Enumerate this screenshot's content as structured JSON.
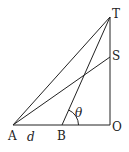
{
  "diagram": {
    "points": {
      "A": {
        "label": "A",
        "x": 13,
        "y": 125
      },
      "B": {
        "label": "B",
        "x": 62,
        "y": 125
      },
      "O": {
        "label": "O",
        "x": 110,
        "y": 125
      },
      "S": {
        "label": "S",
        "x": 110,
        "y": 57
      },
      "T": {
        "label": "T",
        "x": 110,
        "y": 17
      }
    },
    "segments": [
      "AO",
      "OT",
      "AT",
      "AS",
      "BT"
    ],
    "labels": {
      "A": "A",
      "B": "B",
      "O": "O",
      "S": "S",
      "T": "T",
      "distance": "d",
      "angle": "θ"
    },
    "line_color": "#222222"
  }
}
